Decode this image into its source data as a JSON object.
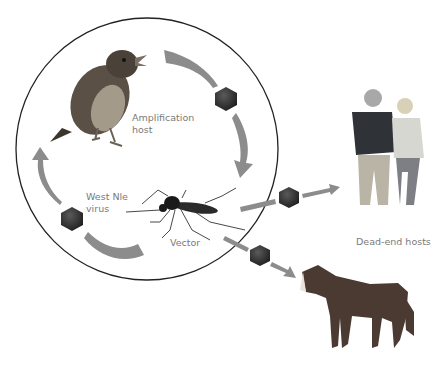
{
  "diagram": {
    "labels": {
      "amplification_line1": "Amplification",
      "amplification_line2": "host",
      "virus_line1": "West Nle",
      "virus_line2": "virus",
      "vector": "Vector",
      "dead_end": "Dead-end hosts"
    },
    "nodes": [
      {
        "id": "bird",
        "role": "Amplification host"
      },
      {
        "id": "mosquito",
        "role": "Vector"
      },
      {
        "id": "humans",
        "role": "Dead-end hosts"
      },
      {
        "id": "horse",
        "role": "Dead-end hosts"
      }
    ],
    "edges": [
      {
        "from": "bird",
        "to": "mosquito",
        "carries": "virus"
      },
      {
        "from": "mosquito",
        "to": "bird",
        "carries": "virus"
      },
      {
        "from": "mosquito",
        "to": "humans",
        "carries": "virus"
      },
      {
        "from": "mosquito",
        "to": "horse",
        "carries": "virus"
      }
    ],
    "colors": {
      "arrow": "#8c8c8c",
      "circle": "#222222",
      "virus": "#2e2e2e",
      "label": "#7a7a7a"
    }
  }
}
